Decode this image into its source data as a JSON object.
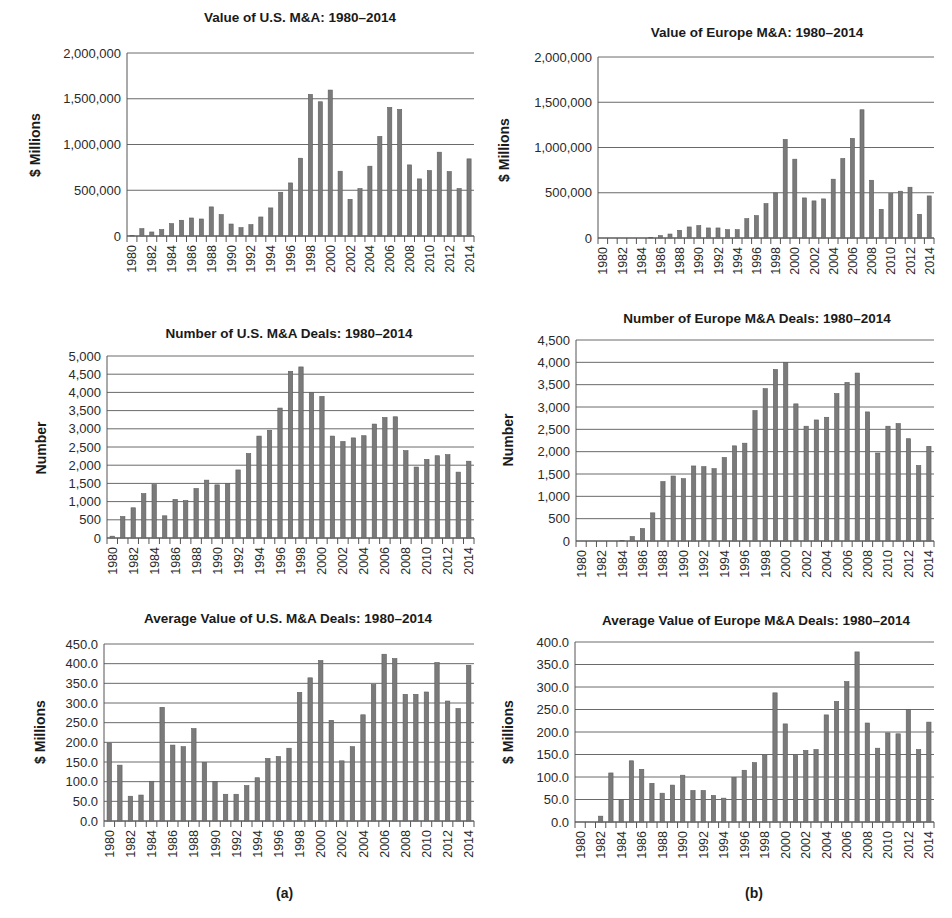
{
  "panels": {
    "a_caption": "(a)",
    "b_caption": "(b)"
  },
  "chart_data": [
    {
      "id": "us-value",
      "type": "bar",
      "title": "Value of U.S. M&A: 1980–2014",
      "xlabel": "",
      "ylabel": "$ Millions",
      "ylim": [
        0,
        2000000
      ],
      "yticks": [
        0,
        500000,
        1000000,
        1500000,
        2000000
      ],
      "ytick_labels": [
        "0",
        "500,000",
        "1,000,000",
        "1,500,000",
        "2,000,000"
      ],
      "grid": true,
      "legend": null,
      "categories": [
        "1980",
        "1981",
        "1982",
        "1983",
        "1984",
        "1985",
        "1986",
        "1987",
        "1988",
        "1989",
        "1990",
        "1991",
        "1992",
        "1993",
        "1994",
        "1995",
        "1996",
        "1997",
        "1998",
        "1999",
        "2000",
        "2001",
        "2002",
        "2003",
        "2004",
        "2005",
        "2006",
        "2007",
        "2008",
        "2009",
        "2010",
        "2011",
        "2012",
        "2013",
        "2014"
      ],
      "xtick_labels": [
        "1980",
        "1982",
        "1984",
        "1986",
        "1988",
        "1990",
        "1992",
        "1994",
        "1996",
        "1998",
        "2000",
        "2002",
        "2004",
        "2006",
        "2008",
        "2010",
        "2012",
        "2014"
      ],
      "values": [
        5000,
        80000,
        44000,
        70000,
        135000,
        172000,
        197000,
        186000,
        318000,
        234000,
        131000,
        91000,
        124000,
        208000,
        307000,
        478000,
        580000,
        850000,
        1548000,
        1467000,
        1595000,
        708000,
        401000,
        518000,
        763000,
        1088000,
        1405000,
        1383000,
        777000,
        624000,
        715000,
        916000,
        704000,
        518000,
        843000
      ]
    },
    {
      "id": "europe-value",
      "type": "bar",
      "title": "Value of Europe M&A: 1980–2014",
      "xlabel": "",
      "ylabel": "$ Millions",
      "ylim": [
        0,
        2000000
      ],
      "yticks": [
        0,
        500000,
        1000000,
        1500000,
        2000000
      ],
      "ytick_labels": [
        "0",
        "500,000",
        "1,000,000",
        "1,500,000",
        "2,000,000"
      ],
      "grid": true,
      "legend": null,
      "categories": [
        "1980",
        "1981",
        "1982",
        "1983",
        "1984",
        "1985",
        "1986",
        "1987",
        "1988",
        "1989",
        "1990",
        "1991",
        "1992",
        "1993",
        "1994",
        "1995",
        "1996",
        "1997",
        "1998",
        "1999",
        "2000",
        "2001",
        "2002",
        "2003",
        "2004",
        "2005",
        "2006",
        "2007",
        "2008",
        "2009",
        "2010",
        "2011",
        "2012",
        "2013",
        "2014"
      ],
      "xtick_labels": [
        "1980",
        "1982",
        "1984",
        "1986",
        "1988",
        "1990",
        "1992",
        "1994",
        "1996",
        "1998",
        "2000",
        "2002",
        "2004",
        "2006",
        "2008",
        "2010",
        "2012",
        "2014"
      ],
      "values": [
        0,
        0,
        0,
        0,
        0,
        5000,
        26000,
        44000,
        85000,
        122000,
        137000,
        111000,
        111000,
        92000,
        92000,
        214000,
        247000,
        380000,
        498000,
        1089000,
        871000,
        443000,
        410000,
        432000,
        650000,
        878000,
        1100000,
        1417000,
        638000,
        317000,
        491000,
        517000,
        561000,
        262000,
        465000
      ]
    },
    {
      "id": "us-deals",
      "type": "bar",
      "title": "Number of U.S. M&A Deals: 1980–2014",
      "xlabel": "",
      "ylabel": "Number",
      "ylim": [
        0,
        5000
      ],
      "yticks": [
        0,
        500,
        1000,
        1500,
        2000,
        2500,
        3000,
        3500,
        4000,
        4500,
        5000
      ],
      "ytick_labels": [
        "0",
        "500",
        "1,000",
        "1,500",
        "2,000",
        "2,500",
        "3,000",
        "3,500",
        "4,000",
        "4,500",
        "5,000"
      ],
      "grid": true,
      "legend": null,
      "categories": [
        "1980",
        "1981",
        "1982",
        "1983",
        "1984",
        "1985",
        "1986",
        "1987",
        "1988",
        "1989",
        "1990",
        "1991",
        "1992",
        "1993",
        "1994",
        "1995",
        "1996",
        "1997",
        "1998",
        "1999",
        "2000",
        "2001",
        "2002",
        "2003",
        "2004",
        "2005",
        "2006",
        "2007",
        "2008",
        "2009",
        "2010",
        "2011",
        "2012",
        "2013",
        "2014"
      ],
      "xtick_labels": [
        "1980",
        "1982",
        "1984",
        "1986",
        "1988",
        "1990",
        "1992",
        "1994",
        "1996",
        "1998",
        "2000",
        "2002",
        "2004",
        "2006",
        "2008",
        "2010",
        "2012",
        "2014"
      ],
      "values": [
        50,
        590,
        830,
        1220,
        1470,
        610,
        1060,
        1030,
        1360,
        1590,
        1460,
        1500,
        1870,
        2320,
        2800,
        2960,
        3570,
        4580,
        4700,
        4000,
        3890,
        2800,
        2650,
        2750,
        2810,
        3130,
        3310,
        3330,
        2400,
        1950,
        2160,
        2260,
        2290,
        1810,
        2110
      ]
    },
    {
      "id": "europe-deals",
      "type": "bar",
      "title": "Number of Europe M&A Deals: 1980–2014",
      "xlabel": "",
      "ylabel": "Number",
      "ylim": [
        0,
        4500
      ],
      "yticks": [
        0,
        500,
        1000,
        1500,
        2000,
        2500,
        3000,
        3500,
        4000,
        4500
      ],
      "ytick_labels": [
        "0",
        "500",
        "1,000",
        "1,500",
        "2,000",
        "2,500",
        "3,000",
        "3,500",
        "4,000",
        "4,500"
      ],
      "grid": true,
      "legend": null,
      "categories": [
        "1980",
        "1981",
        "1982",
        "1983",
        "1984",
        "1985",
        "1986",
        "1987",
        "1988",
        "1989",
        "1990",
        "1991",
        "1992",
        "1993",
        "1994",
        "1995",
        "1996",
        "1997",
        "1998",
        "1999",
        "2000",
        "2001",
        "2002",
        "2003",
        "2004",
        "2005",
        "2006",
        "2007",
        "2008",
        "2009",
        "2010",
        "2011",
        "2012",
        "2013",
        "2014"
      ],
      "xtick_labels": [
        "1980",
        "1982",
        "1984",
        "1986",
        "1988",
        "1990",
        "1992",
        "1994",
        "1996",
        "1998",
        "2000",
        "2002",
        "2004",
        "2006",
        "2008",
        "2010",
        "2012",
        "2014"
      ],
      "values": [
        0,
        0,
        0,
        0,
        10,
        100,
        280,
        630,
        1330,
        1455,
        1395,
        1680,
        1665,
        1620,
        1870,
        2130,
        2190,
        2920,
        3410,
        3840,
        4000,
        3070,
        2570,
        2710,
        2770,
        3300,
        3550,
        3760,
        2890,
        1970,
        2570,
        2630,
        2290,
        1690,
        2120
      ]
    },
    {
      "id": "us-avg",
      "type": "bar",
      "title": "Average Value of U.S. M&A Deals: 1980–2014",
      "xlabel": "",
      "ylabel": "$ Millions",
      "ylim": [
        0,
        450
      ],
      "yticks": [
        0,
        50,
        100,
        150,
        200,
        250,
        300,
        350,
        400,
        450
      ],
      "ytick_labels": [
        "0.0",
        "50.0",
        "100.0",
        "150.0",
        "200.0",
        "250.0",
        "300.0",
        "350.0",
        "400.0",
        "450.0"
      ],
      "grid": true,
      "legend": null,
      "categories": [
        "1980",
        "1981",
        "1982",
        "1983",
        "1984",
        "1985",
        "1986",
        "1987",
        "1988",
        "1989",
        "1990",
        "1991",
        "1992",
        "1993",
        "1994",
        "1995",
        "1996",
        "1997",
        "1998",
        "1999",
        "2000",
        "2001",
        "2002",
        "2003",
        "2004",
        "2005",
        "2006",
        "2007",
        "2008",
        "2009",
        "2010",
        "2011",
        "2012",
        "2013",
        "2014"
      ],
      "xtick_labels": [
        "1980",
        "1982",
        "1984",
        "1986",
        "1988",
        "1990",
        "1992",
        "1994",
        "1996",
        "1998",
        "2000",
        "2002",
        "2004",
        "2006",
        "2008",
        "2010",
        "2012",
        "2014"
      ],
      "values": [
        198,
        142,
        63,
        66,
        101,
        289,
        193,
        189,
        235,
        149,
        100,
        68,
        68,
        90,
        110,
        159,
        164,
        185,
        327,
        364,
        408,
        256,
        153,
        189,
        270,
        347,
        424,
        413,
        322,
        322,
        328,
        403,
        305,
        286,
        396
      ]
    },
    {
      "id": "europe-avg",
      "type": "bar",
      "title": "Average Value of Europe M&A Deals: 1980–2014",
      "xlabel": "",
      "ylabel": "$ Millions",
      "ylim": [
        0,
        400
      ],
      "yticks": [
        0,
        50,
        100,
        150,
        200,
        250,
        300,
        350,
        400
      ],
      "ytick_labels": [
        "0.0",
        "50.0",
        "100.0",
        "150.0",
        "200.0",
        "250.0",
        "300.0",
        "350.0",
        "400.0"
      ],
      "grid": true,
      "legend": null,
      "categories": [
        "1980",
        "1981",
        "1982",
        "1983",
        "1984",
        "1985",
        "1986",
        "1987",
        "1988",
        "1989",
        "1990",
        "1991",
        "1992",
        "1993",
        "1994",
        "1995",
        "1996",
        "1997",
        "1998",
        "1999",
        "2000",
        "2001",
        "2002",
        "2003",
        "2004",
        "2005",
        "2006",
        "2007",
        "2008",
        "2009",
        "2010",
        "2011",
        "2012",
        "2013",
        "2014"
      ],
      "xtick_labels": [
        "1980",
        "1982",
        "1984",
        "1986",
        "1988",
        "1990",
        "1992",
        "1994",
        "1996",
        "1998",
        "2000",
        "2002",
        "2004",
        "2006",
        "2008",
        "2010",
        "2012",
        "2014"
      ],
      "values": [
        0,
        0,
        13,
        109,
        50,
        136,
        117,
        86,
        64,
        82,
        104,
        70,
        70,
        59,
        53,
        99,
        115,
        132,
        148,
        287,
        218,
        148,
        159,
        161,
        238,
        268,
        312,
        378,
        220,
        164,
        198,
        196,
        250,
        161,
        222
      ]
    }
  ]
}
